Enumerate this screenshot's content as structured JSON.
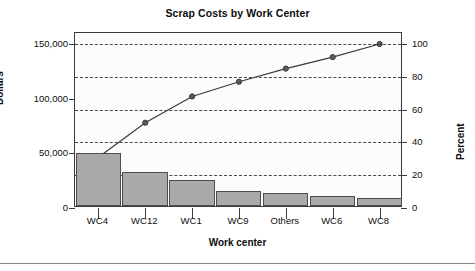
{
  "chart_data": {
    "type": "bar",
    "title": "Scrap Costs by Work Center",
    "xlabel": "Work center",
    "ylabel": "Dollars",
    "ylabel_secondary": "Percent",
    "categories": [
      "WC4",
      "WC12",
      "WC1",
      "WC9",
      "Others",
      "WC6",
      "WC8"
    ],
    "values": [
      48500,
      31500,
      24000,
      13500,
      11500,
      9500,
      7500
    ],
    "series": [
      {
        "name": "Dollars",
        "type": "bar",
        "values": [
          48500,
          31500,
          24000,
          13500,
          11500,
          9500,
          7500
        ]
      },
      {
        "name": "Cumulative Percent",
        "type": "line",
        "values": [
          31,
          52,
          68,
          77,
          85,
          92,
          100
        ]
      }
    ],
    "ylim": [
      0,
      160000
    ],
    "ylim_secondary": [
      0,
      106.7
    ],
    "yticks": [
      0,
      50000,
      100000,
      150000
    ],
    "ytick_labels": [
      "0",
      "50,000",
      "100,000",
      "150,000"
    ],
    "yticks_secondary": [
      0,
      20,
      40,
      60,
      80,
      100
    ],
    "ytick_labels_secondary": [
      "0",
      "20",
      "40",
      "60",
      "80",
      "100"
    ],
    "grid": true,
    "grid_axis": "y-secondary",
    "grid_style": "dashed",
    "legend": "none",
    "bar_color": "#a9a9a9",
    "bar_edge_color": "#4d4d4d",
    "line_color": "#3a3a3a",
    "marker": "filled-circle"
  },
  "axes": {
    "left_ticks": [
      {
        "label": "150,000",
        "value": 150000
      },
      {
        "label": "100,000",
        "value": 100000
      },
      {
        "label": "50,000",
        "value": 50000
      },
      {
        "label": "0",
        "value": 0
      }
    ],
    "right_ticks": [
      {
        "label": "100",
        "value": 100
      },
      {
        "label": "80",
        "value": 80
      },
      {
        "label": "60",
        "value": 60
      },
      {
        "label": "40",
        "value": 40
      },
      {
        "label": "20",
        "value": 20
      },
      {
        "label": "0",
        "value": 0
      }
    ]
  }
}
